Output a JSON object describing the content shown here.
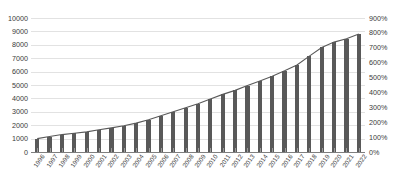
{
  "chart_data": {
    "type": "bar",
    "title": "",
    "subtitle": "",
    "xlabel": "",
    "ylabel": "",
    "y2label": "",
    "grid": true,
    "legend_position": "none",
    "categories": [
      "1996",
      "1997",
      "1998",
      "1999",
      "2000",
      "2001",
      "2002",
      "2003",
      "2004",
      "2005",
      "2006",
      "2007",
      "2008",
      "2009",
      "2010",
      "2011",
      "2012",
      "2013",
      "2014",
      "2015",
      "2016",
      "2017",
      "2018",
      "2019",
      "2020",
      "2021",
      "2022"
    ],
    "ylim": [
      0,
      10000
    ],
    "yticks": [
      0,
      1000,
      2000,
      3000,
      4000,
      5000,
      6000,
      7000,
      8000,
      9000,
      10000
    ],
    "ytick_labels": [
      "0",
      "1000",
      "2000",
      "3000",
      "4000",
      "5000",
      "6000",
      "7000",
      "8000",
      "9000",
      "10000"
    ],
    "y2lim": [
      0,
      900
    ],
    "y2ticks": [
      0,
      100,
      200,
      300,
      400,
      500,
      600,
      700,
      800,
      900
    ],
    "y2tick_labels": [
      "0%",
      "100%",
      "200%",
      "300%",
      "400%",
      "500%",
      "600%",
      "700%",
      "800%",
      "900%"
    ],
    "series": [
      {
        "name": "bars",
        "type": "bar",
        "axis": "left",
        "color": "#595959",
        "values": [
          1000,
          1150,
          1300,
          1400,
          1500,
          1650,
          1800,
          1950,
          2150,
          2400,
          2700,
          3000,
          3300,
          3600,
          3950,
          4300,
          4600,
          4950,
          5300,
          5650,
          6050,
          6500,
          7150,
          7800,
          8200,
          8450,
          8800
        ]
      },
      {
        "name": "line",
        "type": "line",
        "axis": "right",
        "color": "#595959",
        "values": [
          90,
          104,
          117,
          126,
          135,
          149,
          162,
          176,
          194,
          216,
          243,
          270,
          297,
          324,
          356,
          387,
          414,
          446,
          477,
          509,
          545,
          585,
          644,
          702,
          738,
          761,
          792
        ]
      }
    ]
  }
}
